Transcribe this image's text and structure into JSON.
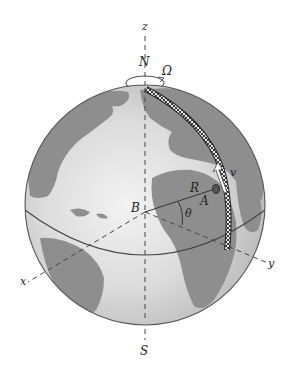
{
  "figure": {
    "type": "rotating-earth-diagram",
    "labels": {
      "z_axis": "z",
      "north": "N",
      "omega": "Ω",
      "south": "S",
      "x_axis": "x",
      "y_axis": "y",
      "center": "B",
      "radius": "R",
      "point": "A",
      "angle": "θ",
      "velocity": "v"
    },
    "colors": {
      "ocean": "#d6d6d6",
      "land": "#8e8e8e",
      "outline": "#555555",
      "rail": "#222222",
      "axis": "#444444"
    },
    "geometry": {
      "globe_center": [
        145,
        205
      ],
      "globe_radius": 120
    }
  }
}
